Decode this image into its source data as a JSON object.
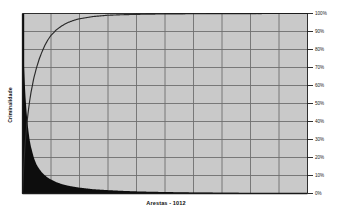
{
  "chart_data": {
    "type": "bar",
    "title": "",
    "subtitle": "",
    "xlabel": "Arestas - 1012",
    "ylabel": "Criminalidade",
    "ylim": [
      0,
      100
    ],
    "xlim": [
      0,
      1012
    ],
    "grid": true,
    "legend": null,
    "y_tick_labels": [
      "0%",
      "10%",
      "20%",
      "30%",
      "40%",
      "50%",
      "60%",
      "70%",
      "80%",
      "90%",
      "100%"
    ],
    "y_tick_values": [
      0,
      10,
      20,
      30,
      40,
      50,
      60,
      70,
      80,
      90,
      100
    ],
    "x_tick_labels": [],
    "x_gridline_count": 10,
    "y_gridline_count": 10,
    "colors": {
      "plot_background": "#c9c9c9",
      "gridline": "#6e6e6e",
      "axis_line": "#1a1a1a",
      "bar_fill": "#0d0d0d",
      "cumulative_line": "#2a2a2a",
      "page_background": "#ffffff",
      "text": "#1a1a1a"
    },
    "series": [
      {
        "name": "Criminalidade",
        "type": "bar",
        "note": "Sorted descending frequency (Pareto); 1012 edges total",
        "x": [
          0,
          5,
          10,
          15,
          20,
          25,
          30,
          40,
          50,
          60,
          70,
          80,
          90,
          100,
          120,
          140,
          160,
          180,
          200,
          250,
          300,
          350,
          400,
          450,
          500,
          600,
          700,
          800,
          900,
          1012
        ],
        "values": [
          100,
          72,
          55,
          44,
          36,
          30,
          26,
          20,
          16,
          13.5,
          11.5,
          10,
          8.8,
          7.8,
          6.3,
          5.2,
          4.4,
          3.8,
          3.3,
          2.4,
          1.9,
          1.5,
          1.2,
          1.0,
          0.85,
          0.6,
          0.45,
          0.3,
          0.2,
          0.1
        ]
      },
      {
        "name": "Cumulativo",
        "type": "line",
        "x": [
          0,
          5,
          10,
          15,
          20,
          25,
          30,
          40,
          50,
          60,
          70,
          80,
          90,
          100,
          120,
          140,
          160,
          180,
          200,
          250,
          300,
          350,
          400,
          450,
          500,
          600,
          700,
          800,
          900,
          1012
        ],
        "values": [
          0,
          17,
          29,
          38,
          45,
          51,
          56,
          64,
          70,
          75,
          79,
          82.5,
          85.3,
          87.6,
          90.9,
          93.2,
          94.9,
          96.1,
          97.0,
          98.3,
          99.0,
          99.3,
          99.5,
          99.65,
          99.75,
          99.86,
          99.92,
          99.96,
          99.99,
          100
        ]
      }
    ]
  },
  "axis_titles": {
    "x": "Arestas - 1012",
    "y": "Criminalidade"
  }
}
